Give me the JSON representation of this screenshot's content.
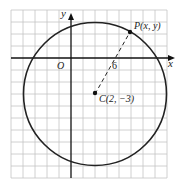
{
  "diagram": {
    "type": "coordinate-circle",
    "axes": {
      "x_label": "x",
      "y_label": "y",
      "origin_label": "O"
    },
    "grid": {
      "cell_units": 1,
      "x_range": [
        -5,
        8
      ],
      "y_range": [
        -10,
        4
      ]
    },
    "circle": {
      "center": [
        2,
        -3
      ],
      "radius": 6
    },
    "center_point": {
      "label": "C(2, −3)"
    },
    "point_on_circle": {
      "label": "P(x, y)"
    },
    "radius_segment": {
      "label": "6",
      "style": "dashed"
    },
    "colors": {
      "grid": "#bdbdbd",
      "axes": "#111111",
      "circle": "#222222",
      "text": "#222222"
    }
  }
}
